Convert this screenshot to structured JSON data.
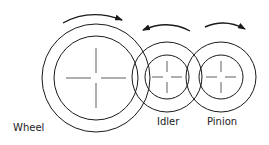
{
  "diagram": {
    "labels": {
      "wheel": "Wheel",
      "idler": "Idler",
      "pinion": "Pinion"
    },
    "line_color": "#1a1a1a",
    "gears": [
      {
        "name": "wheel",
        "cx": 96,
        "cy": 78,
        "outer_r": 54,
        "inner_r": 42,
        "rotation": "clockwise"
      },
      {
        "name": "idler",
        "cx": 167,
        "cy": 77,
        "outer_r": 35,
        "inner_r": 22,
        "rotation": "counterclockwise"
      },
      {
        "name": "pinion",
        "cx": 221,
        "cy": 77,
        "outer_r": 35,
        "inner_r": 22,
        "rotation": "clockwise"
      }
    ]
  }
}
